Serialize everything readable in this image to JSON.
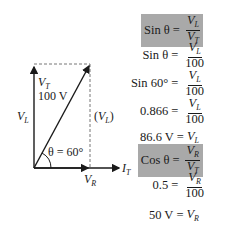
{
  "diagram": {
    "vl_label": {
      "main": "V",
      "sub": "L"
    },
    "vt_label": {
      "main": "V",
      "sub": "T"
    },
    "vt_value": "100 V",
    "vl_dashed_label": {
      "open": "(",
      "main": "V",
      "sub": "L",
      "close": ")"
    },
    "angle_label": "θ = 60°",
    "vr_label": {
      "main": "V",
      "sub": "R"
    },
    "it_label": {
      "main": "I",
      "sub": "T"
    },
    "colors": {
      "line": "#1a1a1a",
      "dashed": "#777777"
    }
  },
  "equations": [
    {
      "lhs": "Sin θ",
      "num": "V_L",
      "num_main": "V",
      "num_sub": "L",
      "den_main": "V",
      "den_sub": "T",
      "boxed": true
    },
    {
      "lhs": "Sin θ",
      "num_main": "V",
      "num_sub": "L",
      "den": "100",
      "boxed": false
    },
    {
      "lhs": "Sin 60°",
      "num_main": "V",
      "num_sub": "L",
      "den": "100",
      "boxed": false
    },
    {
      "lhs": "0.866",
      "num_main": "V",
      "num_sub": "L",
      "den": "100",
      "boxed": false
    },
    {
      "lhs": "86.6 V",
      "rhs_main": "V",
      "rhs_sub": "L",
      "boxed": false
    },
    {
      "lhs": "Cos θ",
      "num_main": "V",
      "num_sub": "R",
      "den_main": "V",
      "den_sub": "T",
      "boxed": true
    },
    {
      "lhs": "0.5",
      "num_main": "V",
      "num_sub": "R",
      "den": "100",
      "boxed": false
    },
    {
      "lhs": "50 V",
      "rhs_main": "V",
      "rhs_sub": "R",
      "boxed": false
    }
  ],
  "equals": "=",
  "highlight_color": "#a9a9a9"
}
